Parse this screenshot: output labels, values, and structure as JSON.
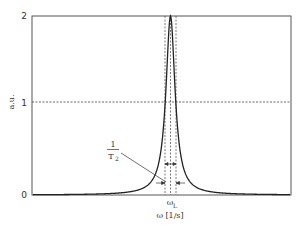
{
  "chart_data": {
    "type": "line",
    "title": "",
    "xlabel": "ω [1/s]",
    "ylabel": "a.u.",
    "ylim": [
      0,
      2
    ],
    "yticks": [
      "0",
      "1",
      "2"
    ],
    "xticks": [
      "ω_L"
    ],
    "grid": false,
    "legend": null,
    "series": [
      {
        "name": "Lorentzian line shape",
        "description": "Lorentzian peak centered at ω_L, peak height 2, half maximum 1",
        "center": "ω_L",
        "peak_value": 2,
        "half_max": 1
      }
    ],
    "annotations": [
      {
        "type": "hline_dashed",
        "y": 1,
        "label": "half maximum"
      },
      {
        "type": "vline_dashed",
        "x": "ω_L",
        "label": "center"
      },
      {
        "type": "vlines_dashed",
        "label": "FWHM boundaries"
      },
      {
        "type": "width_arrows",
        "label_num": "1",
        "label_den": "T",
        "label_sub": "2",
        "meaning": "FWHM = 1/T2"
      }
    ]
  },
  "axes": {
    "y_tick_0": "0",
    "y_tick_1": "1",
    "y_tick_2": "2",
    "y_label": "a.u.",
    "x_tick_center": "ω",
    "x_tick_center_sub": "L",
    "x_label": "ω [1/s]"
  },
  "annotation": {
    "numerator": "1",
    "denominator": "T",
    "denominator_sub": "2"
  }
}
